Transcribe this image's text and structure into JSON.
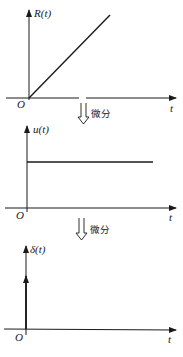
{
  "diagram": {
    "title": "",
    "panels": [
      {
        "id": "ramp",
        "y_label": "R(t)",
        "x_label": "t",
        "origin_label": "O",
        "shape": "ramp"
      },
      {
        "id": "step",
        "y_label": "u(t)",
        "x_label": "t",
        "origin_label": "O",
        "shape": "step"
      },
      {
        "id": "impulse",
        "y_label": "δ(t)",
        "x_label": "t",
        "origin_label": "O",
        "shape": "impulse"
      }
    ],
    "arrows": [
      {
        "label": "微分",
        "from": "ramp",
        "to": "step"
      },
      {
        "label": "微分",
        "from": "step",
        "to": "impulse"
      }
    ],
    "colors": {
      "line": "#1a1a1a",
      "background": "#ffffff"
    }
  }
}
